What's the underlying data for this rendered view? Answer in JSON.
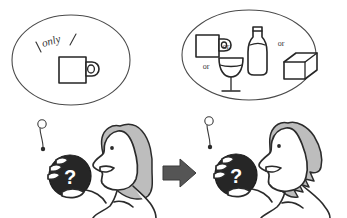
{
  "figure": {
    "type": "hand-drawn-illustration",
    "background_color": "#ffffff",
    "ink_color": "#262626",
    "hair_color": "#bdbdbd",
    "ball_color": "#262626",
    "arrow_color": "#555555",
    "width": 347,
    "height": 218
  },
  "panels": [
    {
      "id": "left",
      "thought_bubble": {
        "label": "only",
        "emphasis_marks": [
          "\\",
          "/"
        ],
        "items": [
          {
            "name": "mug",
            "label": "mug"
          }
        ],
        "connectors": []
      },
      "person": {
        "pose": "profile-facing-left",
        "hair": "rounded-bob",
        "holding": {
          "object": "ball",
          "marking": "?"
        }
      }
    },
    {
      "id": "right",
      "thought_bubble": {
        "label": "",
        "emphasis_marks": [],
        "items": [
          {
            "name": "mug",
            "label": "mug"
          },
          {
            "name": "wine-glass",
            "label": "wine glass"
          },
          {
            "name": "bottle",
            "label": "bottle"
          },
          {
            "name": "cube",
            "label": "cube"
          }
        ],
        "connectors": [
          "or",
          "or",
          "or"
        ]
      },
      "person": {
        "pose": "profile-facing-left",
        "hair": "spiky",
        "holding": {
          "object": "ball",
          "marking": "?"
        }
      }
    }
  ],
  "transition": {
    "icon": "right-arrow",
    "direction": "right"
  },
  "text": {
    "only": "only",
    "or": "or",
    "question_mark": "?"
  }
}
